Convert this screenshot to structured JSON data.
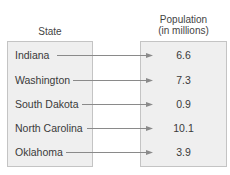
{
  "headers": {
    "state": "State",
    "population_line1": "Population",
    "population_line2": "(in millions)"
  },
  "rows": [
    {
      "state": "Indiana",
      "population": "6.6"
    },
    {
      "state": "Washington",
      "population": "7.3"
    },
    {
      "state": "South Dakota",
      "population": "0.9"
    },
    {
      "state": "North Carolina",
      "population": "10.1"
    },
    {
      "state": "Oklahoma",
      "population": "3.9"
    }
  ],
  "colors": {
    "box_fill": "#efefef",
    "box_border": "#c4c4c4",
    "arrow": "#8a8a8a",
    "text": "#3a3a3a"
  }
}
